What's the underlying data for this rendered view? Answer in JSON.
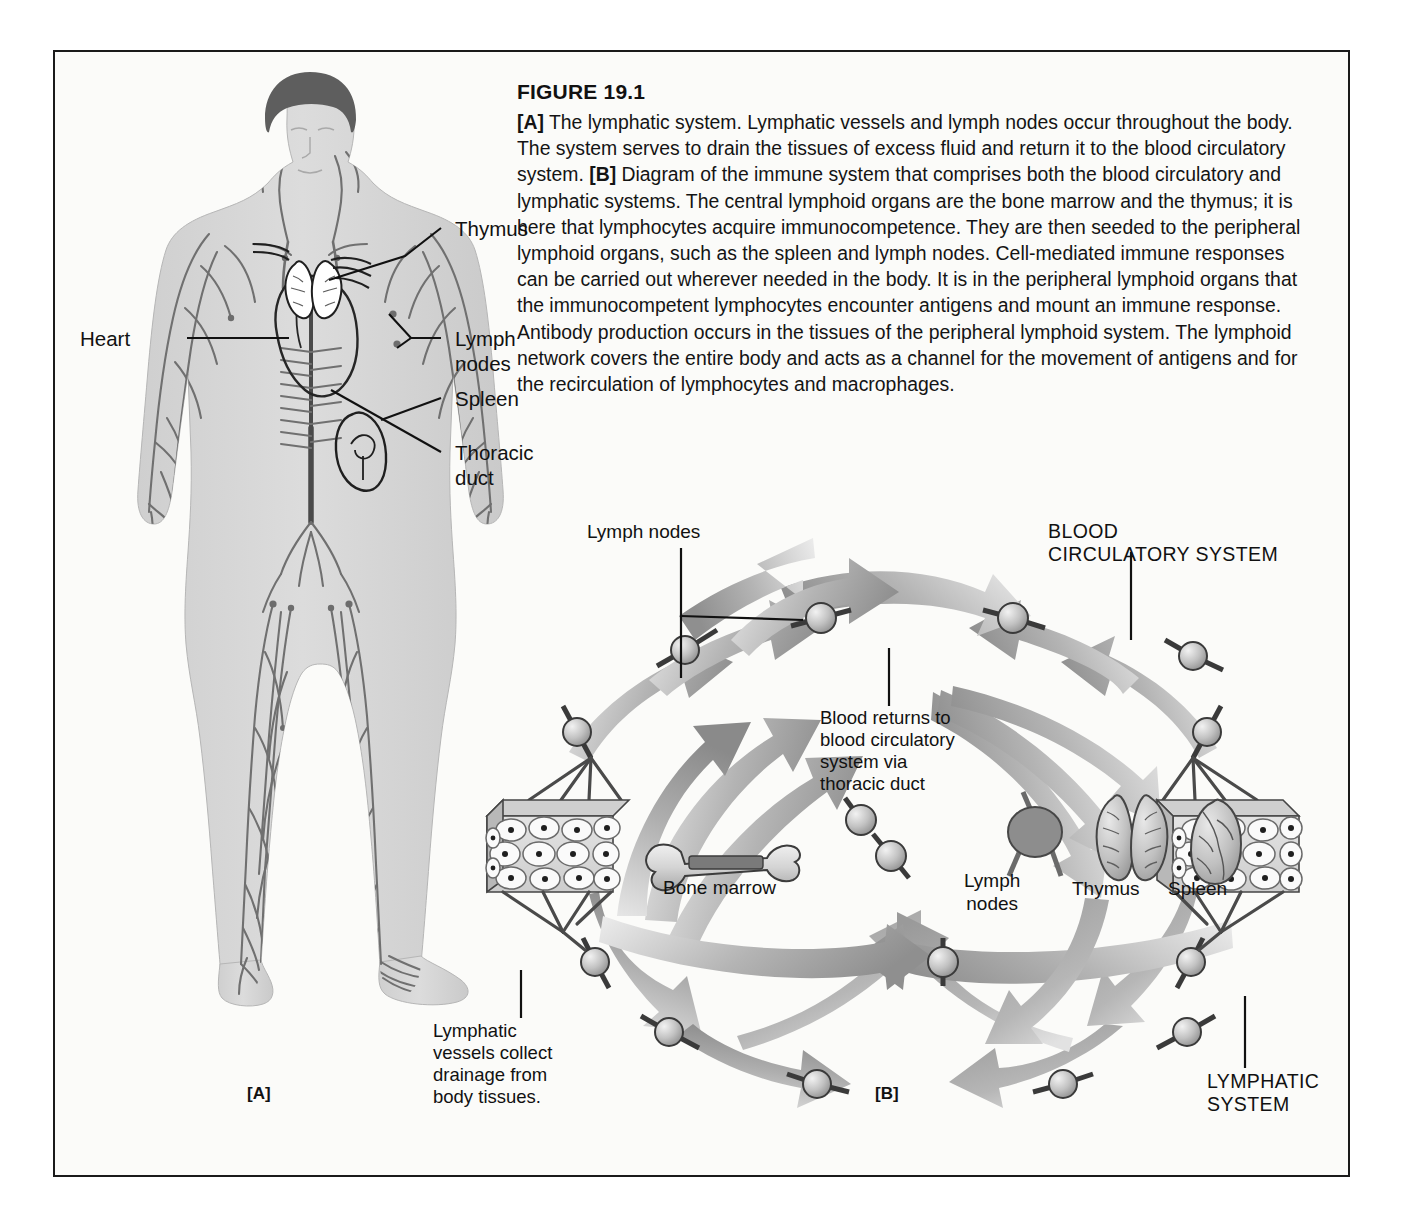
{
  "figure": {
    "title": "FIGURE 19.1",
    "caption_parts": [
      {
        "bold": "[A]",
        "text": " The lymphatic system. Lymphatic vessels and lymph nodes occur throughout the body. The system serves to drain the tissues of excess fluid and return it to the blood circulatory system. "
      },
      {
        "bold": "[B]",
        "text": " Diagram of the immune system that comprises both the blood circulatory and lymphatic systems. The central lymphoid organs are the bone marrow and the thymus; it is here that lymphocytes acquire immunocompetence. They are then seeded to the peripheral lymphoid organs, such as the spleen and lymph nodes. Cell-mediated immune responses can be carried out wherever needed in the body. It is in the peripheral lymphoid organs that the immunocompetent lymphocytes encounter antigens and mount an immune response. Antibody production occurs in the tissues of the peripheral lymphoid system. The lymphoid network covers the entire body and acts as a channel for the movement of antigens and for the recirculation of lymphocytes and macrophages."
      }
    ],
    "caption_full": "[A] The lymphatic system. Lymphatic vessels and lymph nodes occur throughout the body. The system serves to drain the tissues of excess fluid and return it to the blood circulatory system. [B] Diagram of the immune system that comprises both the blood circulatory and lymphatic systems. The central lymphoid organs are the bone marrow and the thymus; it is here that lymphocytes acquire immunocompetence. They are then seeded to the peripheral lymphoid organs, such as the spleen and lymph nodes. Cell-mediated immune responses can be carried out wherever needed in the body. It is in the peripheral lymphoid organs that the immunocompetent lymphocytes encounter antigens and mount an immune response. Antibody production occurs in the tissues of the peripheral lymphoid system. The lymphoid network covers the entire body and acts as a channel for the movement of antigens and for the recirculation of lymphocytes and macrophages."
  },
  "panel_a": {
    "letter": "[A]",
    "labels": {
      "thymus": "Thymus",
      "lymph_nodes": "Lymph\nnodes",
      "spleen": "Spleen",
      "thoracic_duct": "Thoracic\nduct",
      "heart": "Heart"
    }
  },
  "panel_b": {
    "letter": "[B]",
    "labels": {
      "lymph_nodes_top": "Lymph nodes",
      "blood_circulatory_system": "BLOOD\nCIRCULATORY SYSTEM",
      "blood_returns": "Blood returns to\nblood circulatory\nsystem via\nthoracic duct",
      "bone_marrow": "Bone marrow",
      "lymph_nodes_organ": "Lymph\nnodes",
      "thymus_organ": "Thymus",
      "spleen_organ": "Spleen",
      "lymphatic_vessels": "Lymphatic\nvessels collect\ndrainage from\nbody tissues.",
      "lymphatic_system": "LYMPHATIC\nSYSTEM"
    }
  },
  "colors": {
    "frame_border": "#1a1a1a",
    "page_background": "#fbfbf9",
    "body_fill": "#d7d7d7",
    "hair_fill": "#595959",
    "vessel_stroke": "#6e6e6e",
    "arrow_dark": "#8c8c8c",
    "arrow_light": "#d9d9d9",
    "node_fill": "#bdbdbd",
    "node_stroke": "#3a3a3a",
    "organ_fill": "#c8c8c8",
    "text": "#111111"
  }
}
